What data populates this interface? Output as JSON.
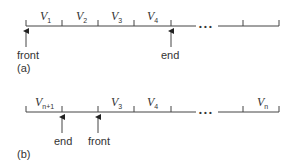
{
  "diagram_a": {
    "caption": "(a)",
    "cells": [
      {
        "var": "V",
        "sub": "1"
      },
      {
        "var": "V",
        "sub": "2"
      },
      {
        "var": "V",
        "sub": "3"
      },
      {
        "var": "V",
        "sub": "4"
      }
    ],
    "ellipsis": "• • •",
    "pointers": {
      "front": "front",
      "end": "end"
    }
  },
  "diagram_b": {
    "caption": "(b)",
    "cells": [
      {
        "var": "V",
        "sub": "n+1"
      },
      {
        "var": "",
        "sub": ""
      },
      {
        "var": "V",
        "sub": "3"
      },
      {
        "var": "V",
        "sub": "4"
      }
    ],
    "last_cell": {
      "var": "V",
      "sub": "n"
    },
    "ellipsis": "• • •",
    "pointers": {
      "end": "end",
      "front": "front"
    }
  }
}
